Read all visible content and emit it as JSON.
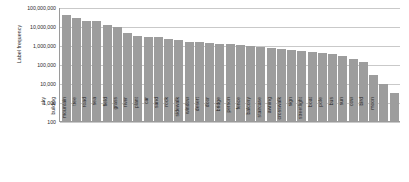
{
  "chart_data": {
    "type": "bar",
    "title": "",
    "subtitle": "",
    "xlabel": "",
    "ylabel": "Label frequency",
    "yscale": "log",
    "ylim": [
      100,
      100000000
    ],
    "ytick_labels": [
      "100,000,000",
      "10,000,000",
      "1,000,000",
      "100,000",
      "10,000",
      "1,000",
      "100"
    ],
    "ytick_values": [
      100000000,
      10000000,
      1000000,
      100000,
      10000,
      1000,
      100
    ],
    "grid": true,
    "legend": null,
    "bar_color": "#9d9d9d",
    "categories": [
      "sky",
      "building",
      "mountain",
      "tree",
      "road",
      "sea",
      "field",
      "grass",
      "river",
      "plant",
      "car",
      "sand",
      "rock",
      "sidewalk",
      "window",
      "desert",
      "door",
      "bridge",
      "person",
      "fence",
      "balcony",
      "staircase",
      "awning",
      "crosswalk",
      "sign",
      "streetlight",
      "boat",
      "pole",
      "bus",
      "sun",
      "cow",
      "bird",
      "moon"
    ],
    "values": [
      40000000,
      27000000,
      19000000,
      18000000,
      11000000,
      9000000,
      4500000,
      3100000,
      2700000,
      2600000,
      2000000,
      1800000,
      1500000,
      1400000,
      1300000,
      1200000,
      1100000,
      1000000,
      900000,
      800000,
      700000,
      620000,
      560000,
      500000,
      450000,
      400000,
      330000,
      260000,
      190000,
      130000,
      28000,
      9000,
      3000
    ]
  }
}
